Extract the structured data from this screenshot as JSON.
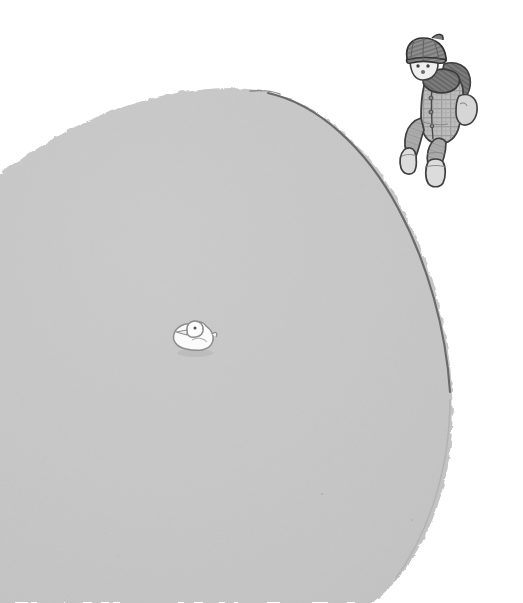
{
  "scene": {
    "title": "Child walking down a snowy hill with a small white duck",
    "width": 523,
    "height": 603,
    "background_color": "#ffffff",
    "medium": "children's book illustration, pencil and wash",
    "alt_text": "A large pale grey snow mound fills most of the page. A tiny white duck sits near the middle left of the mound. A child in a knit cap, scarf, plaid jacket and boots walks down the right-hand slope."
  },
  "hill": {
    "label": "Snow hill",
    "fill_color": "#c9c9c9",
    "texture_color": "#c0c0c0",
    "outline_color": "#6b6b6b",
    "edge_softness": "grainy"
  },
  "duck": {
    "label": "Toy duck",
    "body_color": "#fcfcfc",
    "outline_color": "#8a8a8a",
    "shadow_color": "#b4b4b4",
    "eye_color": "#555555",
    "beak_color": "#f2f2f2",
    "position": {
      "x": 175,
      "y": 320
    },
    "size": {
      "width": 40,
      "height": 34
    }
  },
  "child": {
    "label": "Child in winter clothes",
    "position": {
      "x": 400,
      "y": 38
    },
    "size": {
      "width": 74,
      "height": 150
    },
    "facing": "left",
    "action": "walking down the slope",
    "parts": [
      {
        "name": "knit-cap",
        "color": "#8c8c8c",
        "detail": "ribbed stripes"
      },
      {
        "name": "face",
        "color": "#efefef",
        "detail": "two eyes and a nose"
      },
      {
        "name": "scarf",
        "color": "#767676",
        "detail": "wrapped around neck, trailing right"
      },
      {
        "name": "plaid-jacket",
        "color": "#b7b7b7",
        "detail": "checked pattern with buttons"
      },
      {
        "name": "mitten",
        "color": "#d4d4d4",
        "detail": "right hand mitten"
      },
      {
        "name": "trousers",
        "color": "#a9a9a9",
        "detail": "bent knee, mid-stride"
      },
      {
        "name": "boots",
        "color": "#d8d8d8",
        "detail": "two boots, one raised"
      }
    ],
    "outline_color": "#4a4a4a"
  }
}
